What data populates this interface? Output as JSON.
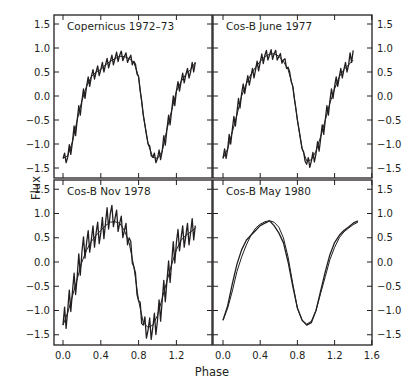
{
  "chart_data": [
    {
      "type": "line",
      "title": "Copernicus 1972–73",
      "position": "top-left",
      "xlabel": "Phase",
      "ylabel": "Flux",
      "xlim": [
        -0.1,
        1.5
      ],
      "ylim": [
        -1.7,
        1.7
      ],
      "xticks": [
        0.0,
        0.4,
        0.8,
        1.2
      ],
      "yticks": [
        -1.5,
        -1.0,
        -0.5,
        0.0,
        0.5,
        1.0,
        1.5
      ],
      "series": [
        {
          "name": "observed (noisy)",
          "x": [
            0.0,
            0.05,
            0.1,
            0.15,
            0.2,
            0.25,
            0.3,
            0.35,
            0.4,
            0.45,
            0.5,
            0.55,
            0.6,
            0.65,
            0.7,
            0.75,
            0.8,
            0.85,
            0.9,
            0.95,
            1.0,
            1.05,
            1.1,
            1.15,
            1.2,
            1.25,
            1.3,
            1.35,
            1.4
          ],
          "y": [
            -1.3,
            -1.28,
            -0.95,
            -0.5,
            -0.1,
            0.2,
            0.4,
            0.5,
            0.55,
            0.65,
            0.72,
            0.78,
            0.85,
            0.82,
            0.78,
            0.72,
            0.4,
            -0.4,
            -1.0,
            -1.28,
            -1.3,
            -1.15,
            -0.7,
            -0.3,
            0.1,
            0.3,
            0.45,
            0.5,
            0.7
          ]
        },
        {
          "name": "model",
          "x": [
            0.0,
            0.05,
            0.1,
            0.15,
            0.2,
            0.25,
            0.3,
            0.35,
            0.4,
            0.45,
            0.5,
            0.55,
            0.6,
            0.65,
            0.7,
            0.75,
            0.8,
            0.85,
            0.9,
            0.95,
            1.0,
            1.05,
            1.1,
            1.15,
            1.2,
            1.25,
            1.3,
            1.35,
            1.4
          ],
          "y": [
            -1.3,
            -1.25,
            -0.95,
            -0.5,
            -0.1,
            0.2,
            0.4,
            0.5,
            0.55,
            0.65,
            0.72,
            0.78,
            0.83,
            0.82,
            0.78,
            0.7,
            0.4,
            -0.4,
            -1.0,
            -1.28,
            -1.3,
            -1.15,
            -0.7,
            -0.3,
            0.1,
            0.3,
            0.45,
            0.55,
            0.7
          ]
        }
      ]
    },
    {
      "type": "line",
      "title": "Cos-B June 1977",
      "position": "top-right",
      "xlabel": "Phase",
      "ylabel": "Flux",
      "xlim": [
        -0.1,
        1.6
      ],
      "ylim": [
        -1.7,
        1.7
      ],
      "xticks": [
        0.0,
        0.4,
        0.8,
        1.2,
        1.6
      ],
      "yticks": [
        -1.5,
        -1.0,
        -0.5,
        0.0,
        0.5,
        1.0,
        1.5
      ],
      "series": [
        {
          "name": "observed (noisy)",
          "x": [
            0.0,
            0.05,
            0.1,
            0.15,
            0.2,
            0.25,
            0.3,
            0.35,
            0.4,
            0.45,
            0.5,
            0.55,
            0.6,
            0.65,
            0.7,
            0.75,
            0.8,
            0.85,
            0.9,
            0.95,
            1.0,
            1.05,
            1.1,
            1.15,
            1.2,
            1.25,
            1.3,
            1.35,
            1.4
          ],
          "y": [
            -1.3,
            -1.1,
            -0.7,
            -0.35,
            0.05,
            0.25,
            0.4,
            0.55,
            0.7,
            0.85,
            0.85,
            0.88,
            0.82,
            0.75,
            0.6,
            0.2,
            -0.5,
            -1.1,
            -1.42,
            -1.35,
            -1.2,
            -0.9,
            -0.5,
            -0.1,
            0.2,
            0.4,
            0.55,
            0.65,
            0.95
          ]
        },
        {
          "name": "model",
          "x": [
            0.0,
            0.05,
            0.1,
            0.15,
            0.2,
            0.25,
            0.3,
            0.35,
            0.4,
            0.45,
            0.5,
            0.55,
            0.6,
            0.65,
            0.7,
            0.75,
            0.8,
            0.85,
            0.9,
            0.95,
            1.0,
            1.05,
            1.1,
            1.15,
            1.2,
            1.25,
            1.3,
            1.35,
            1.4
          ],
          "y": [
            -1.3,
            -1.1,
            -0.75,
            -0.4,
            0.0,
            0.25,
            0.45,
            0.6,
            0.72,
            0.82,
            0.87,
            0.88,
            0.83,
            0.72,
            0.55,
            0.2,
            -0.5,
            -1.1,
            -1.35,
            -1.33,
            -1.15,
            -0.85,
            -0.5,
            -0.15,
            0.15,
            0.4,
            0.55,
            0.65,
            0.75
          ]
        }
      ]
    },
    {
      "type": "line",
      "title": "Cos-B Nov 1978",
      "position": "bottom-left",
      "xlabel": "Phase",
      "ylabel": "Flux",
      "xlim": [
        -0.1,
        1.5
      ],
      "ylim": [
        -1.7,
        1.7
      ],
      "xticks": [
        0.0,
        0.4,
        0.8,
        1.2
      ],
      "xtick_labels": [
        "0.0",
        "0.4",
        "0.8",
        "1.2"
      ],
      "yticks": [
        -1.5,
        -1.0,
        -0.5,
        0.0,
        0.5,
        1.0,
        1.5
      ],
      "series": [
        {
          "name": "observed (noisy)",
          "x": [
            0.0,
            0.05,
            0.1,
            0.15,
            0.2,
            0.25,
            0.3,
            0.35,
            0.4,
            0.45,
            0.5,
            0.55,
            0.6,
            0.65,
            0.7,
            0.75,
            0.8,
            0.85,
            0.9,
            0.95,
            1.0,
            1.05,
            1.1,
            1.15,
            1.2,
            1.25,
            1.3,
            1.35,
            1.4
          ],
          "y": [
            -1.3,
            -1.0,
            -0.6,
            -0.3,
            0.2,
            0.4,
            0.45,
            0.6,
            0.6,
            0.8,
            1.0,
            0.9,
            0.8,
            0.65,
            0.5,
            -0.1,
            -0.8,
            -1.3,
            -1.4,
            -1.35,
            -1.2,
            -0.8,
            -0.4,
            0.0,
            0.4,
            0.5,
            0.55,
            0.6,
            0.75
          ]
        },
        {
          "name": "model",
          "x": [
            0.0,
            0.05,
            0.1,
            0.15,
            0.2,
            0.25,
            0.3,
            0.35,
            0.4,
            0.45,
            0.5,
            0.55,
            0.6,
            0.65,
            0.7,
            0.75,
            0.8,
            0.85,
            0.9,
            0.95,
            1.0,
            1.05,
            1.1,
            1.15,
            1.2,
            1.25,
            1.3,
            1.35,
            1.4
          ],
          "y": [
            -1.3,
            -1.05,
            -0.7,
            -0.35,
            0.0,
            0.25,
            0.42,
            0.55,
            0.65,
            0.75,
            0.82,
            0.83,
            0.8,
            0.65,
            0.4,
            -0.1,
            -0.8,
            -1.25,
            -1.35,
            -1.3,
            -1.1,
            -0.75,
            -0.4,
            -0.05,
            0.25,
            0.45,
            0.55,
            0.62,
            0.7
          ]
        }
      ]
    },
    {
      "type": "line",
      "title": "Cos-B May 1980",
      "position": "bottom-right",
      "xlabel": "Phase",
      "ylabel": "Flux",
      "xlim": [
        -0.1,
        1.6
      ],
      "ylim": [
        -1.7,
        1.7
      ],
      "xticks": [
        0.0,
        0.4,
        0.8,
        1.2,
        1.6
      ],
      "xtick_labels": [
        "0.0",
        "0.4",
        "0.8",
        "1.2",
        "1.6"
      ],
      "yticks": [
        -1.5,
        -1.0,
        -0.5,
        0.0,
        0.5,
        1.0,
        1.5
      ],
      "series": [
        {
          "name": "observed",
          "x": [
            0.0,
            0.05,
            0.1,
            0.15,
            0.2,
            0.25,
            0.3,
            0.35,
            0.4,
            0.45,
            0.5,
            0.55,
            0.6,
            0.65,
            0.7,
            0.75,
            0.8,
            0.85,
            0.9,
            0.95,
            1.0,
            1.05,
            1.1,
            1.15,
            1.2,
            1.25,
            1.3,
            1.35,
            1.4,
            1.45
          ],
          "y": [
            -1.2,
            -0.9,
            -0.45,
            -0.05,
            0.25,
            0.45,
            0.55,
            0.65,
            0.75,
            0.8,
            0.85,
            0.75,
            0.6,
            0.4,
            0.0,
            -0.5,
            -0.95,
            -1.2,
            -1.3,
            -1.25,
            -1.0,
            -0.6,
            -0.2,
            0.15,
            0.4,
            0.55,
            0.65,
            0.72,
            0.8,
            0.85
          ]
        },
        {
          "name": "model",
          "x": [
            0.0,
            0.05,
            0.1,
            0.15,
            0.2,
            0.25,
            0.3,
            0.35,
            0.4,
            0.45,
            0.5,
            0.55,
            0.6,
            0.65,
            0.7,
            0.75,
            0.8,
            0.85,
            0.9,
            0.95,
            1.0,
            1.05,
            1.1,
            1.15,
            1.2,
            1.25,
            1.3,
            1.35,
            1.4,
            1.45
          ],
          "y": [
            -1.2,
            -0.95,
            -0.6,
            -0.2,
            0.1,
            0.35,
            0.55,
            0.7,
            0.78,
            0.83,
            0.85,
            0.82,
            0.72,
            0.5,
            0.1,
            -0.45,
            -0.95,
            -1.2,
            -1.28,
            -1.22,
            -1.0,
            -0.65,
            -0.3,
            0.05,
            0.3,
            0.5,
            0.62,
            0.7,
            0.77,
            0.82
          ]
        }
      ]
    }
  ],
  "figure": {
    "xlabel": "Phase",
    "ylabel": "Flux",
    "left_ytick_labels": [
      "1.5",
      "1.0",
      "0.5",
      "0.0",
      "−0.5",
      "−1.0",
      "−1.5"
    ],
    "right_ytick_labels": [
      "1.5",
      "1.0",
      "0.5",
      "0.0",
      "−0.5",
      "−1.0",
      "−1.5"
    ]
  }
}
